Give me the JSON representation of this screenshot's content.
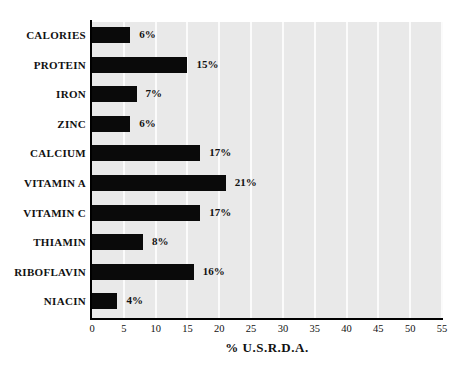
{
  "chart_data": {
    "type": "bar",
    "orientation": "horizontal",
    "title": "",
    "xlabel": "% U.S.R.D.A.",
    "ylabel": "",
    "xlim": [
      0,
      55
    ],
    "xticks": [
      0,
      5,
      10,
      15,
      20,
      25,
      30,
      35,
      40,
      45,
      50,
      55
    ],
    "xtick_labels": [
      "0",
      "5",
      "10",
      "15",
      "20",
      "25",
      "30",
      "35",
      "40",
      "45",
      "50",
      "55"
    ],
    "grid": true,
    "grid_axis": "x",
    "legend": false,
    "categories": [
      "CALORIES",
      "PROTEIN",
      "IRON",
      "ZINC",
      "CALCIUM",
      "VITAMIN A",
      "VITAMIN C",
      "THIAMIN",
      "RIBOFLAVIN",
      "NIACIN"
    ],
    "values": [
      6,
      15,
      7,
      6,
      17,
      21,
      17,
      8,
      16,
      4
    ],
    "data_labels": [
      "6%",
      "15%",
      "7%",
      "6%",
      "17%",
      "21%",
      "17%",
      "8%",
      "16%",
      "4%"
    ],
    "bar_color": "#0a0a0a",
    "plot_background": "#e9e9e9",
    "gridline_color": "#fbfbfb",
    "axis_color": "#000000"
  }
}
